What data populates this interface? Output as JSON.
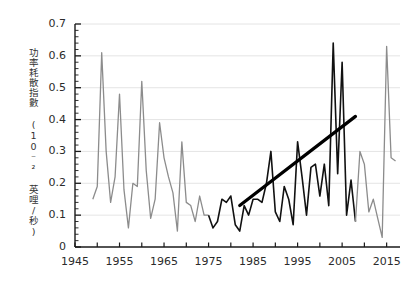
{
  "chart_data": {
    "type": "line",
    "title": "",
    "xlabel": "",
    "ylabel": "功率耗散指數 (10⁻² 英哩/秒)",
    "ylabel_text": "功率耗散指數",
    "ylabel_units": "(10⁻² 英哩/秒)",
    "xlim": [
      1945,
      2018
    ],
    "ylim": [
      0,
      0.7
    ],
    "ytick_labels": [
      "0.7",
      "0.6",
      "0.5",
      "0.4",
      "0.3",
      "0.2",
      "0.1",
      "0"
    ],
    "ytick_values": [
      0.7,
      0.6,
      0.5,
      0.4,
      0.3,
      0.2,
      0.1,
      0
    ],
    "yminor_step": 0.02,
    "xtick_labels": [
      "1945",
      "1955",
      "1965",
      "1975",
      "1985",
      "1995",
      "2005",
      "2015"
    ],
    "xtick_values": [
      1945,
      1955,
      1965,
      1975,
      1985,
      1995,
      2005,
      2015
    ],
    "xminor_step": 5,
    "grid": "horizontal",
    "legend": "none",
    "series": [
      {
        "name": "功率耗散指數",
        "color_early": "#8c8c8c",
        "color_mid": "#111111",
        "color_late": "#8c8c8c",
        "highlight_start_year": 1975,
        "highlight_end_year": 2008,
        "x": [
          1949,
          1950,
          1951,
          1952,
          1953,
          1954,
          1955,
          1956,
          1957,
          1958,
          1959,
          1960,
          1961,
          1962,
          1963,
          1964,
          1965,
          1966,
          1967,
          1968,
          1969,
          1970,
          1971,
          1972,
          1973,
          1974,
          1975,
          1976,
          1977,
          1978,
          1979,
          1980,
          1981,
          1982,
          1983,
          1984,
          1985,
          1986,
          1987,
          1988,
          1989,
          1990,
          1991,
          1992,
          1993,
          1994,
          1995,
          1996,
          1997,
          1998,
          1999,
          2000,
          2001,
          2002,
          2003,
          2004,
          2005,
          2006,
          2007,
          2008,
          2009,
          2010,
          2011,
          2012,
          2013,
          2014,
          2015,
          2016,
          2017
        ],
        "y": [
          0.15,
          0.19,
          0.61,
          0.3,
          0.14,
          0.22,
          0.48,
          0.18,
          0.06,
          0.2,
          0.19,
          0.52,
          0.24,
          0.09,
          0.15,
          0.39,
          0.28,
          0.22,
          0.17,
          0.05,
          0.33,
          0.14,
          0.13,
          0.08,
          0.16,
          0.1,
          0.1,
          0.06,
          0.08,
          0.15,
          0.14,
          0.16,
          0.07,
          0.05,
          0.13,
          0.1,
          0.15,
          0.15,
          0.14,
          0.2,
          0.3,
          0.11,
          0.08,
          0.19,
          0.15,
          0.07,
          0.33,
          0.22,
          0.1,
          0.25,
          0.26,
          0.16,
          0.26,
          0.13,
          0.64,
          0.23,
          0.58,
          0.1,
          0.21,
          0.08,
          0.3,
          0.26,
          0.11,
          0.15,
          0.09,
          0.03,
          0.63,
          0.28,
          0.27
        ]
      }
    ],
    "trend_line": {
      "name": "上升趨勢線",
      "color": "#000000",
      "x_start": 1982,
      "y_start": 0.13,
      "x_end": 2008,
      "y_end": 0.41
    }
  },
  "axis": {
    "y_ticks": [
      "0.7",
      "0.6",
      "0.5",
      "0.4",
      "0.3",
      "0.2",
      "0.1",
      "0"
    ],
    "x_ticks": [
      "1945",
      "1955",
      "1965",
      "1975",
      "1985",
      "1995",
      "2005",
      "2015"
    ]
  }
}
